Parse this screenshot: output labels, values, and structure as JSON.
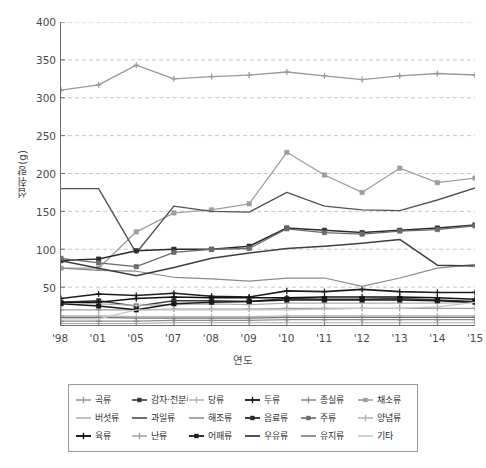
{
  "chart_data": {
    "type": "line",
    "title": "",
    "xlabel": "연도",
    "ylabel": "섭취량(g)",
    "ylim": [
      0,
      400
    ],
    "ytick_step": 50,
    "yticks": [
      400,
      350,
      300,
      250,
      200,
      150,
      100,
      50
    ],
    "grid": "horizontal-dashed",
    "legend_position": "bottom",
    "x": [
      "'98",
      "'01",
      "'05",
      "'07",
      "'08",
      "'09",
      "'10",
      "'11",
      "'12",
      "'13",
      "'14",
      "'15"
    ],
    "categories": [
      "'98",
      "'01",
      "'05",
      "'07",
      "'08",
      "'09",
      "'10",
      "'11",
      "'12",
      "'13",
      "'14",
      "'15"
    ],
    "series": [
      {
        "name": "곡류",
        "color": "#9a9a9a",
        "marker": "plus",
        "width": 1.3,
        "values": [
          310,
          317,
          343,
          325,
          328,
          330,
          334,
          329,
          324,
          329,
          332,
          330
        ]
      },
      {
        "name": "감자·전분류",
        "color": "#3b3b3b",
        "marker": "square",
        "width": 1.3,
        "values": [
          30,
          32,
          25,
          32,
          32,
          31,
          35,
          34,
          34,
          35,
          33,
          31
        ]
      },
      {
        "name": "당류",
        "color": "#b4b4b4",
        "marker": "plus",
        "width": 1.3,
        "values": [
          12,
          12,
          11,
          11,
          11,
          11,
          12,
          12,
          12,
          12,
          12,
          12
        ]
      },
      {
        "name": "두류",
        "color": "#1f1f1f",
        "marker": "plus",
        "width": 1.6,
        "values": [
          35,
          41,
          39,
          42,
          38,
          37,
          45,
          44,
          47,
          44,
          43,
          43
        ]
      },
      {
        "name": "종실류",
        "color": "#8d8d8d",
        "marker": "plus",
        "width": 1.3,
        "values": [
          5,
          5,
          5,
          6,
          6,
          6,
          7,
          7,
          7,
          7,
          7,
          7
        ]
      },
      {
        "name": "채소류",
        "color": "#9e9e9e",
        "marker": "square",
        "width": 1.3,
        "values": [
          75,
          75,
          123,
          148,
          152,
          160,
          228,
          198,
          175,
          207,
          188,
          194
        ]
      },
      {
        "name": "버섯류",
        "color": "#a8a8a8",
        "marker": "none",
        "width": 1.1,
        "values": [
          2,
          2,
          2,
          3,
          3,
          3,
          3,
          3,
          3,
          3,
          3,
          3
        ]
      },
      {
        "name": "과일류",
        "color": "#555555",
        "marker": "none",
        "width": 1.4,
        "values": [
          180,
          180,
          95,
          157,
          150,
          149,
          175,
          157,
          152,
          151,
          165,
          181
        ]
      },
      {
        "name": "해조류",
        "color": "#8a8a8a",
        "marker": "none",
        "width": 1.2,
        "values": [
          75,
          72,
          71,
          63,
          61,
          58,
          62,
          62,
          51,
          62,
          75,
          80
        ]
      },
      {
        "name": "음료류",
        "color": "#2c2c2c",
        "marker": "square",
        "width": 1.5,
        "values": [
          85,
          87,
          98,
          100,
          100,
          104,
          128,
          125,
          122,
          125,
          128,
          132
        ]
      },
      {
        "name": "주류",
        "color": "#6b6b6b",
        "marker": "square",
        "width": 1.3,
        "values": [
          88,
          82,
          77,
          96,
          100,
          101,
          127,
          122,
          120,
          124,
          126,
          131
        ]
      },
      {
        "name": "양념류",
        "color": "#b0b0b0",
        "marker": "plus",
        "width": 1.2,
        "values": [
          30,
          28,
          26,
          27,
          28,
          27,
          29,
          29,
          29,
          29,
          29,
          30
        ]
      },
      {
        "name": "육류",
        "color": "#121212",
        "marker": "plus",
        "width": 1.6,
        "values": [
          30,
          30,
          35,
          37,
          36,
          36,
          36,
          37,
          37,
          37,
          36,
          34
        ]
      },
      {
        "name": "난류",
        "color": "#a0a0a0",
        "marker": "plus",
        "width": 1.2,
        "values": [
          20,
          20,
          20,
          21,
          21,
          21,
          22,
          22,
          22,
          22,
          22,
          22
        ]
      },
      {
        "name": "어패류",
        "color": "#1a1a1a",
        "marker": "square",
        "width": 1.5,
        "values": [
          28,
          25,
          20,
          28,
          30,
          31,
          33,
          33,
          33,
          33,
          32,
          30
        ]
      },
      {
        "name": "우유류",
        "color": "#3f3f3f",
        "marker": "none",
        "width": 1.5,
        "values": [
          85,
          75,
          65,
          76,
          88,
          95,
          101,
          104,
          108,
          113,
          79,
          78
        ]
      },
      {
        "name": "유지류",
        "color": "#707070",
        "marker": "none",
        "width": 1.2,
        "values": [
          10,
          10,
          9,
          9,
          9,
          9,
          10,
          10,
          10,
          10,
          10,
          10
        ]
      },
      {
        "name": "기타",
        "color": "#c4c4c4",
        "marker": "none",
        "width": 1.2,
        "values": [
          8,
          8,
          20,
          20,
          20,
          20,
          20,
          21,
          22,
          22,
          24,
          30
        ]
      }
    ]
  },
  "axes": {
    "y_title": "섭취량(g)",
    "x_title": "연도",
    "y_labels": [
      "400",
      "350",
      "300",
      "250",
      "200",
      "150",
      "100",
      "50"
    ],
    "x_labels": [
      "'98",
      "'01",
      "'05",
      "'07",
      "'08",
      "'09",
      "'10",
      "'11",
      "'12",
      "'13",
      "'14",
      "'15"
    ]
  },
  "legend": {
    "items": [
      {
        "label": "곡류"
      },
      {
        "label": "감자·전분류"
      },
      {
        "label": "당류"
      },
      {
        "label": "두류"
      },
      {
        "label": "종실류"
      },
      {
        "label": "채소류"
      },
      {
        "label": "버섯류"
      },
      {
        "label": "과일류"
      },
      {
        "label": "해조류"
      },
      {
        "label": "음료류"
      },
      {
        "label": "주류"
      },
      {
        "label": "양념류"
      },
      {
        "label": "육류"
      },
      {
        "label": "난류"
      },
      {
        "label": "어패류"
      },
      {
        "label": "우유류"
      },
      {
        "label": "유지류"
      },
      {
        "label": "기타"
      }
    ]
  },
  "colors": {
    "axis": "#6f6f6f",
    "grid": "#b9b9b9",
    "text": "#3a3a3a",
    "legend_border": "#9a9a9a",
    "background": "#ffffff"
  }
}
